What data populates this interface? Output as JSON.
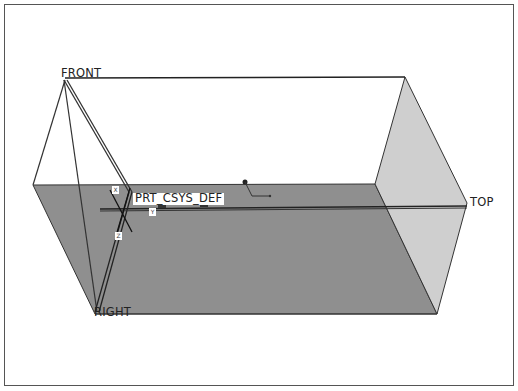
{
  "viewport": {
    "background": "#ffffff",
    "border_color": "#555555"
  },
  "datums": {
    "front": {
      "label": "FRONT"
    },
    "top": {
      "label": "TOP"
    },
    "right": {
      "label": "RIGHT"
    }
  },
  "csys": {
    "label": "PRT_CSYS_DEF",
    "axes": [
      "X",
      "Y",
      "Z"
    ]
  },
  "colors": {
    "top_plane_fill": "#8f8f8f",
    "right_plane_fill": "#cfcfcf",
    "edge": "#333333"
  }
}
